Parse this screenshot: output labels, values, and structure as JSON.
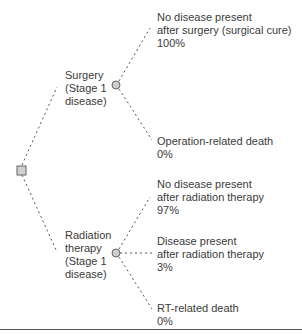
{
  "diagram": {
    "type": "decision-tree",
    "decision_node": {
      "shape": "square"
    },
    "strategies": [
      {
        "label_lines": [
          "Surgery",
          "(Stage 1",
          "disease)"
        ],
        "outcomes": [
          {
            "lines": [
              "No disease present",
              "after surgery (surgical cure)"
            ],
            "probability": "100%"
          },
          {
            "lines": [
              "Operation-related death"
            ],
            "probability": "0%"
          }
        ]
      },
      {
        "label_lines": [
          "Radiation",
          "therapy",
          "(Stage 1",
          "disease)"
        ],
        "outcomes": [
          {
            "lines": [
              "No disease present",
              "after radiation therapy"
            ],
            "probability": "97%"
          },
          {
            "lines": [
              "Disease present",
              "after radiation therapy"
            ],
            "probability": "3%"
          },
          {
            "lines": [
              "RT-related death"
            ],
            "probability": "0%"
          }
        ]
      }
    ],
    "colors": {
      "line": "#555555",
      "node_fill": "#cccccc",
      "node_stroke": "#666666",
      "text": "#3b3b3b"
    }
  }
}
